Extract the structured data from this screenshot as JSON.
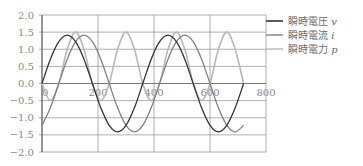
{
  "chart_data": {
    "type": "line",
    "title": "",
    "xlabel": "",
    "ylabel": "",
    "xlim": [
      0,
      800
    ],
    "ylim": [
      -2.0,
      2.0
    ],
    "x_ticks": [
      "0",
      "200",
      "400",
      "600",
      "800"
    ],
    "y_ticks": [
      "2.0",
      "1.5",
      "1.0",
      "0.5",
      "0.0",
      "−0.5",
      "−1.0",
      "−1.5",
      "−2.0"
    ],
    "grid": true,
    "legend_position": "right",
    "x": [
      0,
      30,
      60,
      90,
      120,
      150,
      180,
      210,
      240,
      270,
      300,
      330,
      360,
      390,
      420,
      450,
      480,
      510,
      540,
      570,
      600,
      630,
      660,
      690,
      720
    ],
    "series": [
      {
        "name": "瞬時電圧 v",
        "color": "#333333",
        "values": [
          0.0,
          0.71,
          1.22,
          1.41,
          1.22,
          0.71,
          0.0,
          -0.71,
          -1.22,
          -1.41,
          -1.22,
          -0.71,
          0.0,
          0.71,
          1.22,
          1.41,
          1.22,
          0.71,
          0.0,
          -0.71,
          -1.22,
          -1.41,
          -1.22,
          -0.71,
          0.0
        ]
      },
      {
        "name": "瞬時電流 i",
        "color": "#808080",
        "values": [
          -1.22,
          -0.71,
          0.0,
          0.71,
          1.22,
          1.41,
          1.22,
          0.71,
          0.0,
          -0.71,
          -1.22,
          -1.41,
          -1.22,
          -0.71,
          0.0,
          0.71,
          1.22,
          1.41,
          1.22,
          0.71,
          0.0,
          -0.71,
          -1.22,
          -1.41,
          -1.22
        ]
      },
      {
        "name": "瞬時電力 p",
        "color": "#b8b8b8",
        "values": [
          0.0,
          -0.5,
          0.0,
          1.0,
          1.5,
          1.0,
          0.0,
          -0.5,
          0.0,
          1.0,
          1.5,
          1.0,
          0.0,
          -0.5,
          0.0,
          1.0,
          1.5,
          1.0,
          0.0,
          -0.5,
          0.0,
          1.0,
          1.5,
          1.0,
          0.0
        ]
      }
    ]
  },
  "legend": {
    "items": [
      {
        "label": "瞬時電圧 ",
        "var": "v"
      },
      {
        "label": "瞬時電流 ",
        "var": "i"
      },
      {
        "label": "瞬時電力 ",
        "var": "p"
      }
    ]
  }
}
